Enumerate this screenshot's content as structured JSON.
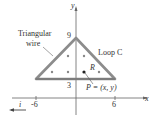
{
  "diagram": {
    "axes": {
      "x_label": "x",
      "y_label": "y",
      "unit_vector_label": "i"
    },
    "ticks": {
      "x_neg": "-6",
      "x_pos": "6",
      "y_top": "9",
      "y_base": "3"
    },
    "labels": {
      "wire_line1": "Triangular",
      "wire_line2": "wire",
      "loop": "Loop C",
      "region": "R",
      "point": "P = (x, y)"
    },
    "triangle_vertices": [
      [
        -6,
        3
      ],
      [
        0,
        9
      ],
      [
        6,
        3
      ]
    ],
    "colors": {
      "wire": "#8a8a8a",
      "axes": "#555555",
      "dots": "#888888",
      "point": "#222222"
    }
  }
}
